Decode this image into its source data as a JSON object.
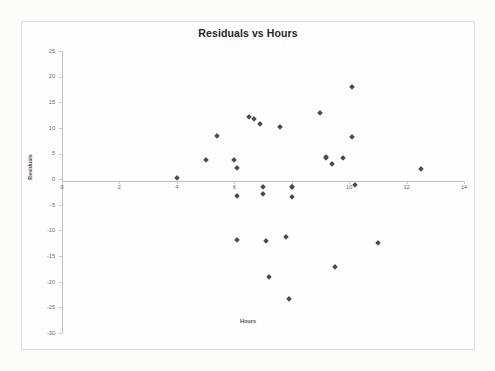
{
  "chart_data": {
    "type": "scatter",
    "title": "Residuals vs Hours",
    "xlabel": "Hours",
    "ylabel": "Residuals",
    "xlim": [
      0,
      14
    ],
    "ylim": [
      -30,
      25
    ],
    "xticks": [
      0,
      2,
      4,
      6,
      8,
      10,
      12,
      14
    ],
    "yticks": [
      25,
      20,
      15,
      10,
      5,
      0,
      -5,
      -10,
      -15,
      -20,
      -25,
      -30
    ],
    "xtick_labels": [
      "0",
      "2",
      "4",
      "6",
      "8",
      "10",
      "12",
      "14"
    ],
    "ytick_labels": [
      "25",
      "20",
      "15",
      "10",
      "5",
      "0",
      "-5",
      "-10",
      "-15",
      "-20",
      "-25",
      "-30"
    ],
    "grid": false,
    "legend": false,
    "marker": "diamond",
    "marker_color": "#4a4a52",
    "series": [
      {
        "name": "Residuals",
        "points": [
          [
            4.0,
            0.2
          ],
          [
            5.0,
            3.7
          ],
          [
            5.4,
            8.4
          ],
          [
            6.0,
            3.7
          ],
          [
            6.1,
            2.1
          ],
          [
            6.1,
            -3.3
          ],
          [
            6.1,
            -11.8
          ],
          [
            6.5,
            12.2
          ],
          [
            6.7,
            11.8
          ],
          [
            6.9,
            10.7
          ],
          [
            7.0,
            -1.5
          ],
          [
            7.0,
            -2.9
          ],
          [
            7.1,
            -12.0
          ],
          [
            7.2,
            -19.1
          ],
          [
            7.6,
            10.1
          ],
          [
            7.8,
            -11.3
          ],
          [
            7.9,
            -23.4
          ],
          [
            8.0,
            -1.5
          ],
          [
            8.0,
            -1.6
          ],
          [
            8.0,
            -3.4
          ],
          [
            9.0,
            12.9
          ],
          [
            9.2,
            4.4
          ],
          [
            9.2,
            4.2
          ],
          [
            9.4,
            3.0
          ],
          [
            9.5,
            -17.1
          ],
          [
            9.8,
            4.2
          ],
          [
            10.1,
            17.9
          ],
          [
            10.1,
            8.2
          ],
          [
            10.2,
            -1.1
          ],
          [
            11.0,
            -12.5
          ],
          [
            12.5,
            2.0
          ]
        ]
      }
    ]
  },
  "chart": {
    "title": "Residuals vs Hours",
    "x_axis_title": "Hours",
    "y_axis_title": "Residuals"
  }
}
